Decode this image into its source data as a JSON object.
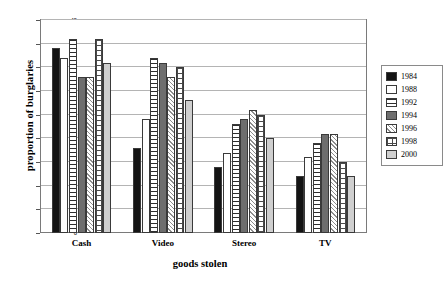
{
  "chart_data": {
    "type": "bar",
    "title": "",
    "xlabel": "goods stolen",
    "ylabel": "proportion of burglaries",
    "categories": [
      "Cash",
      "Video",
      "Stereo",
      "TV"
    ],
    "ylim": [
      0,
      45
    ],
    "yticks": [
      0,
      5,
      10,
      15,
      20,
      25,
      30,
      35,
      40,
      45
    ],
    "grid": true,
    "legend_position": "right-outside",
    "series": [
      {
        "name": "1984",
        "pattern": "solid-black",
        "color": "#141414",
        "values": [
          39,
          18,
          14,
          12
        ]
      },
      {
        "name": "1988",
        "pattern": "solid-white",
        "color": "#ffffff",
        "values": [
          37,
          24,
          17,
          16
        ]
      },
      {
        "name": "1992",
        "pattern": "horizontal-lines",
        "color": "#2e2e2e",
        "values": [
          41,
          37,
          23,
          19
        ]
      },
      {
        "name": "1994",
        "pattern": "solid-dark-gray",
        "color": "#6e6e6e",
        "values": [
          33,
          36,
          24,
          21
        ]
      },
      {
        "name": "1996",
        "pattern": "diagonal-hatch",
        "color": "#8d8d8d",
        "values": [
          33,
          33,
          26,
          21
        ]
      },
      {
        "name": "1998",
        "pattern": "cross-hatch-grid",
        "color": "#4a4a4a",
        "values": [
          41,
          35,
          25,
          15
        ]
      },
      {
        "name": "2000",
        "pattern": "solid-light-gray",
        "color": "#cfcfcf",
        "values": [
          36,
          28,
          20,
          12
        ]
      }
    ]
  },
  "legend": {
    "items": [
      {
        "label": "1984"
      },
      {
        "label": "1988"
      },
      {
        "label": "1992"
      },
      {
        "label": "1994"
      },
      {
        "label": "1996"
      },
      {
        "label": "1998"
      },
      {
        "label": "2000"
      }
    ]
  },
  "yaxis": {
    "ticks": [
      "45",
      "40",
      "35",
      "30",
      "25",
      "20",
      "15",
      "10",
      "5",
      "0"
    ]
  }
}
